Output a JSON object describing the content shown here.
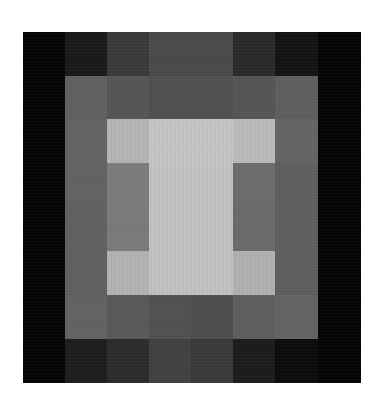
{
  "artwork": {
    "origin": {
      "x": 23,
      "y": 32
    },
    "col_edges": [
      23,
      65,
      107,
      149,
      191,
      233,
      275,
      318,
      361
    ],
    "row_edges": [
      32,
      76,
      119,
      163,
      207,
      251,
      295,
      339,
      383
    ],
    "rows": [
      [
        "#050505",
        "#1a1a1a",
        "#3a3a3a",
        "#4a4a4a",
        "#4a4a4a",
        "#2a2a2a",
        "#141414",
        "#050505"
      ],
      [
        "#050505",
        "#606060",
        "#555555",
        "#505050",
        "#505050",
        "#555555",
        "#5e5e5e",
        "#050505"
      ],
      [
        "#050505",
        "#636363",
        "#b4b4b4",
        "#c4c4c4",
        "#c4c4c4",
        "#bababa",
        "#646464",
        "#050505"
      ],
      [
        "#050505",
        "#626262",
        "#7c7c7c",
        "#c2c2c2",
        "#c2c2c2",
        "#6c6c6c",
        "#5f5f5f",
        "#050505"
      ],
      [
        "#050505",
        "#616161",
        "#7a7a7a",
        "#c1c1c1",
        "#c1c1c1",
        "#6a6a6a",
        "#5f5f5f",
        "#050505"
      ],
      [
        "#050505",
        "#606060",
        "#b2b2b2",
        "#c0c0c0",
        "#c0c0c0",
        "#b0b0b0",
        "#5e5e5e",
        "#050505"
      ],
      [
        "#050505",
        "#626262",
        "#595959",
        "#515151",
        "#4e4e4e",
        "#5e5e5e",
        "#636363",
        "#050505"
      ],
      [
        "#050505",
        "#1e1e1e",
        "#2c2c2c",
        "#414141",
        "#3a3a3a",
        "#1c1c1c",
        "#0c0c0c",
        "#050505"
      ]
    ]
  }
}
